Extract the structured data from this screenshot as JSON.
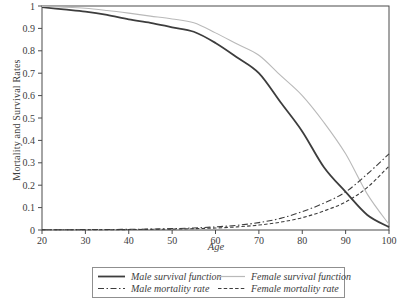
{
  "figure": {
    "background": "#ffffff",
    "axis_color": "#4a4a4a",
    "text_color": "#3c3c3c"
  },
  "chart_data": {
    "type": "line",
    "title": "",
    "xlabel": "Age",
    "ylabel": "Mortality and Survival Rates",
    "xlim": [
      20,
      100
    ],
    "ylim": [
      0,
      1
    ],
    "grid": false,
    "legend_position": "bottom",
    "x_ticks": [
      20,
      30,
      40,
      50,
      60,
      70,
      80,
      90,
      100
    ],
    "y_ticks": [
      0,
      0.1,
      0.2,
      0.3,
      0.4,
      0.5,
      0.6,
      0.7,
      0.8,
      0.9,
      1
    ],
    "y_tick_labels": [
      "0",
      "0.1",
      "0.2",
      "0.3",
      "0.4",
      "0.5",
      "0.6",
      "0.7",
      "0.8",
      "0.9",
      "1"
    ],
    "x": [
      20,
      25,
      30,
      35,
      40,
      45,
      50,
      55,
      60,
      65,
      70,
      75,
      80,
      85,
      90,
      95,
      100
    ],
    "series": [
      {
        "name": "Male survival function",
        "values": [
          0.995,
          0.985,
          0.975,
          0.96,
          0.94,
          0.925,
          0.905,
          0.885,
          0.835,
          0.77,
          0.7,
          0.57,
          0.44,
          0.28,
          0.17,
          0.067,
          0.013
        ],
        "style": "solid",
        "color": "#3d3d3d",
        "width": 1.8
      },
      {
        "name": "Female survival function",
        "values": [
          0.998,
          0.995,
          0.99,
          0.98,
          0.968,
          0.955,
          0.942,
          0.925,
          0.88,
          0.83,
          0.78,
          0.69,
          0.6,
          0.48,
          0.34,
          0.16,
          0.025
        ],
        "style": "solid",
        "color": "#b9b9b9",
        "width": 1.1
      },
      {
        "name": "Male mortality rate",
        "values": [
          0.001,
          0.001,
          0.002,
          0.002,
          0.003,
          0.004,
          0.006,
          0.009,
          0.014,
          0.021,
          0.033,
          0.052,
          0.082,
          0.12,
          0.17,
          0.25,
          0.34
        ],
        "style": "dashdot",
        "color": "#3d3d3d",
        "width": 1.1
      },
      {
        "name": "Female mortality rate",
        "values": [
          0.001,
          0.001,
          0.001,
          0.001,
          0.002,
          0.003,
          0.004,
          0.006,
          0.009,
          0.014,
          0.022,
          0.035,
          0.055,
          0.085,
          0.125,
          0.19,
          0.285
        ],
        "style": "dashed",
        "color": "#3d3d3d",
        "width": 1.1
      }
    ]
  },
  "legend": {
    "items": [
      {
        "label": "Male survival function"
      },
      {
        "label": "Female survival function"
      },
      {
        "label": "Male mortality rate"
      },
      {
        "label": "Female mortality rate"
      }
    ]
  }
}
